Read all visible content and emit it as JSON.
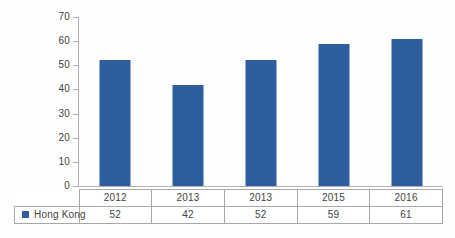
{
  "chart_data": {
    "type": "bar",
    "title": "",
    "subtitle": "",
    "xlabel": "",
    "ylabel": "",
    "categories": [
      "2012",
      "2013",
      "2013",
      "2015",
      "2016"
    ],
    "series": [
      {
        "name": "Hong Kong",
        "values": [
          52,
          42,
          52,
          59,
          61
        ],
        "color": "#2e5e9e"
      }
    ],
    "ylim": [
      0,
      70
    ],
    "ytick_step": 10,
    "ytick_labels": [
      "70",
      "60",
      "50",
      "40",
      "30",
      "20",
      "10",
      "0"
    ],
    "ytick_values": [
      70,
      60,
      50,
      40,
      30,
      20,
      10,
      0
    ],
    "grid": false,
    "legend_position": "table-row-label",
    "annotations": []
  },
  "table": {
    "legend_label": "Hong Kong",
    "legend_marker": "blue-square",
    "header_row": [
      "2012",
      "2013",
      "2013",
      "2015",
      "2016"
    ],
    "value_row": [
      "52",
      "42",
      "52",
      "59",
      "61"
    ]
  },
  "colors": {
    "bar": "#2e5e9e",
    "axis": "#b0b0b0",
    "table_border": "#a8a8a8",
    "text": "#3f3f3f",
    "background": "#ffffff"
  }
}
